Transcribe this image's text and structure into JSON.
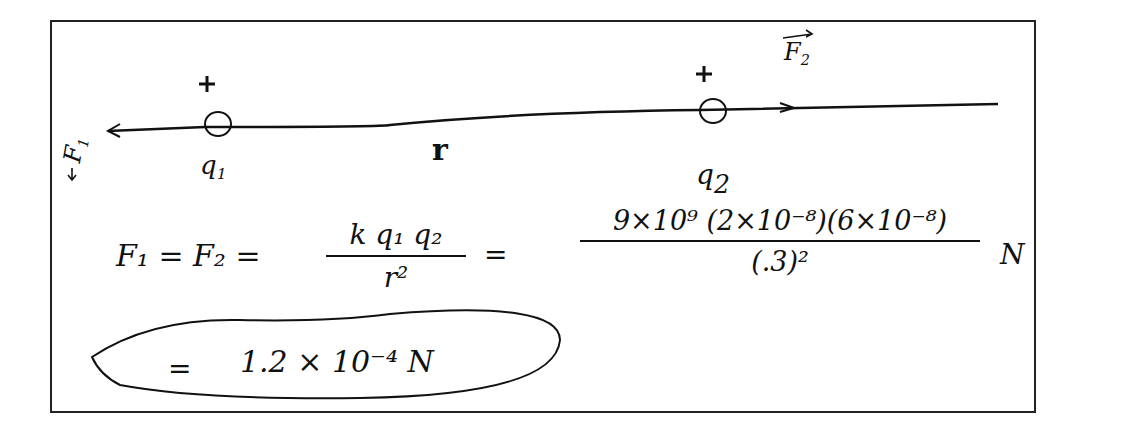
{
  "diagram": {
    "charges": [
      {
        "label": "q",
        "subscript": "1",
        "sign": "+"
      },
      {
        "label": "q",
        "subscript": "2",
        "sign": "+"
      }
    ],
    "separation_label": "r",
    "forces": [
      {
        "label": "F",
        "subscript": "1",
        "direction": "left"
      },
      {
        "label": "F",
        "subscript": "2",
        "direction": "right"
      }
    ]
  },
  "equation": {
    "lhs": "F₁ = F₂ =",
    "formula_numerator": "k q₁ q₂",
    "formula_denominator": "r²",
    "equals": "=",
    "numeric_numerator": "9×10⁹ (2×10⁻⁸)(6×10⁻⁸)",
    "numeric_denominator": "(.3)²",
    "unit": "N",
    "result_prefix": "=",
    "result": "1.2 × 10⁻⁴ N"
  },
  "colors": {
    "ink": "#111111",
    "background": "#ffffff",
    "border": "#222222"
  }
}
